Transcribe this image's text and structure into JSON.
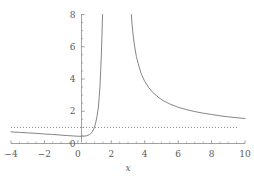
{
  "chart_data": {
    "type": "line",
    "title": "",
    "subtitle": "",
    "xlabel": "x",
    "ylabel": "",
    "xlim": [
      -4,
      10
    ],
    "ylim": [
      0,
      8
    ],
    "grid": false,
    "legend": null,
    "xticks": [
      -4,
      -2,
      0,
      2,
      4,
      6,
      8,
      10
    ],
    "xtick_labels": [
      "−4",
      "−2",
      "0",
      "2",
      "4",
      "6",
      "8",
      "10"
    ],
    "yticks": [
      0,
      2,
      4,
      6,
      8
    ],
    "ytick_labels": [
      "0",
      "2",
      "4",
      "6",
      "8"
    ],
    "minor_ticks": true,
    "series": [
      {
        "name": "curve-left-branch",
        "style": "solid",
        "color": "#777777",
        "points": [
          [
            -4,
            0.72
          ],
          [
            -3.5,
            0.69
          ],
          [
            -3,
            0.66
          ],
          [
            -2.5,
            0.63
          ],
          [
            -2,
            0.59
          ],
          [
            -1.5,
            0.56
          ],
          [
            -1,
            0.52
          ],
          [
            -0.6,
            0.49
          ],
          [
            -0.3,
            0.47
          ],
          [
            0,
            0.45
          ],
          [
            0.3,
            0.45
          ],
          [
            0.5,
            0.47
          ],
          [
            0.7,
            0.55
          ],
          [
            0.85,
            0.7
          ],
          [
            0.95,
            0.9
          ],
          [
            1.05,
            1.2
          ],
          [
            1.15,
            1.7
          ],
          [
            1.22,
            2.2
          ],
          [
            1.28,
            2.9
          ],
          [
            1.33,
            3.7
          ],
          [
            1.37,
            4.6
          ],
          [
            1.41,
            5.6
          ],
          [
            1.44,
            6.6
          ],
          [
            1.46,
            7.4
          ],
          [
            1.48,
            8.0
          ]
        ]
      },
      {
        "name": "curve-right-branch",
        "style": "solid",
        "color": "#777777",
        "points": [
          [
            3.2,
            8.0
          ],
          [
            3.25,
            7.3
          ],
          [
            3.32,
            6.6
          ],
          [
            3.4,
            6.0
          ],
          [
            3.5,
            5.4
          ],
          [
            3.65,
            4.8
          ],
          [
            3.8,
            4.3
          ],
          [
            4.0,
            3.85
          ],
          [
            4.25,
            3.45
          ],
          [
            4.5,
            3.15
          ],
          [
            4.8,
            2.88
          ],
          [
            5.1,
            2.66
          ],
          [
            5.5,
            2.45
          ],
          [
            6.0,
            2.25
          ],
          [
            6.5,
            2.1
          ],
          [
            7.0,
            1.98
          ],
          [
            7.5,
            1.88
          ],
          [
            8.0,
            1.8
          ],
          [
            8.5,
            1.72
          ],
          [
            9.0,
            1.65
          ],
          [
            9.5,
            1.6
          ],
          [
            10,
            1.55
          ]
        ]
      }
    ],
    "annotations": [
      {
        "name": "horizontal-asymptote",
        "type": "hline",
        "y": 1,
        "style": "dotted",
        "color": "#777777",
        "x_start": -4,
        "x_end": 9.6
      }
    ],
    "axis_color": "#8a8a8a",
    "background_color": "#ffffff"
  }
}
